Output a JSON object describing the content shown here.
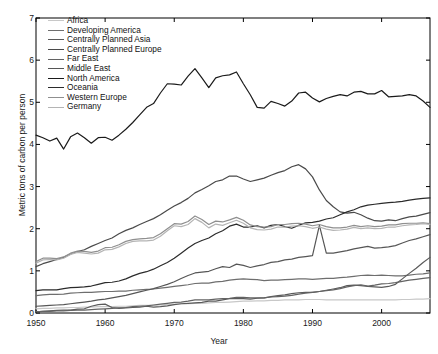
{
  "chart_data": {
    "type": "line",
    "title": "",
    "xlabel": "Year",
    "ylabel": "Metric tons of carbon per person",
    "xlim": [
      1950,
      2007
    ],
    "ylim": [
      0,
      7
    ],
    "xticks": [
      1950,
      1960,
      1970,
      1980,
      1990,
      2000
    ],
    "yticks": [
      0,
      1,
      2,
      3,
      4,
      5,
      6,
      7
    ],
    "grid": false,
    "legend_position": "top-left",
    "x": [
      1950,
      1951,
      1952,
      1953,
      1954,
      1955,
      1956,
      1957,
      1958,
      1959,
      1960,
      1961,
      1962,
      1963,
      1964,
      1965,
      1966,
      1967,
      1968,
      1969,
      1970,
      1971,
      1972,
      1973,
      1974,
      1975,
      1976,
      1977,
      1978,
      1979,
      1980,
      1981,
      1982,
      1983,
      1984,
      1985,
      1986,
      1987,
      1988,
      1989,
      1990,
      1991,
      1992,
      1993,
      1994,
      1995,
      1996,
      1997,
      1998,
      1999,
      2000,
      2001,
      2002,
      2003,
      2004,
      2005,
      2006,
      2007
    ],
    "series": [
      {
        "name": "Africa",
        "color": "#c8c8c8",
        "values": [
          0.1,
          0.11,
          0.11,
          0.12,
          0.12,
          0.13,
          0.13,
          0.14,
          0.14,
          0.15,
          0.15,
          0.15,
          0.16,
          0.16,
          0.17,
          0.18,
          0.18,
          0.18,
          0.19,
          0.2,
          0.21,
          0.22,
          0.22,
          0.23,
          0.23,
          0.24,
          0.25,
          0.25,
          0.26,
          0.27,
          0.28,
          0.28,
          0.29,
          0.29,
          0.3,
          0.3,
          0.31,
          0.31,
          0.31,
          0.32,
          0.32,
          0.32,
          0.31,
          0.31,
          0.31,
          0.31,
          0.31,
          0.31,
          0.31,
          0.31,
          0.31,
          0.31,
          0.31,
          0.32,
          0.32,
          0.33,
          0.33,
          0.34
        ]
      },
      {
        "name": "Developing America",
        "color": "#6e6e6e",
        "values": [
          0.41,
          0.43,
          0.44,
          0.44,
          0.45,
          0.47,
          0.48,
          0.49,
          0.49,
          0.5,
          0.51,
          0.51,
          0.52,
          0.52,
          0.54,
          0.55,
          0.56,
          0.57,
          0.59,
          0.61,
          0.63,
          0.65,
          0.67,
          0.7,
          0.71,
          0.71,
          0.74,
          0.75,
          0.78,
          0.8,
          0.81,
          0.8,
          0.79,
          0.77,
          0.78,
          0.78,
          0.79,
          0.8,
          0.81,
          0.81,
          0.8,
          0.81,
          0.82,
          0.82,
          0.84,
          0.85,
          0.87,
          0.89,
          0.9,
          0.89,
          0.9,
          0.89,
          0.88,
          0.88,
          0.9,
          0.92,
          0.93,
          0.95
        ]
      },
      {
        "name": "Centrally Planned Asia",
        "color": "#5a5a5a",
        "values": [
          0.03,
          0.04,
          0.05,
          0.06,
          0.07,
          0.07,
          0.09,
          0.1,
          0.16,
          0.2,
          0.21,
          0.13,
          0.11,
          0.12,
          0.13,
          0.14,
          0.16,
          0.14,
          0.15,
          0.17,
          0.2,
          0.22,
          0.23,
          0.24,
          0.25,
          0.28,
          0.28,
          0.31,
          0.34,
          0.34,
          0.34,
          0.33,
          0.35,
          0.36,
          0.39,
          0.41,
          0.43,
          0.46,
          0.48,
          0.49,
          0.49,
          0.51,
          0.54,
          0.57,
          0.6,
          0.65,
          0.66,
          0.65,
          0.63,
          0.62,
          0.61,
          0.63,
          0.68,
          0.81,
          0.94,
          1.06,
          1.2,
          1.32
        ]
      },
      {
        "name": "Centrally Planned Europe",
        "color": "#4a4a4a",
        "values": [
          1.1,
          1.17,
          1.22,
          1.27,
          1.32,
          1.4,
          1.46,
          1.5,
          1.58,
          1.65,
          1.72,
          1.78,
          1.88,
          1.96,
          2.02,
          2.1,
          2.17,
          2.24,
          2.33,
          2.44,
          2.54,
          2.62,
          2.72,
          2.85,
          2.93,
          3.02,
          3.12,
          3.16,
          3.25,
          3.25,
          3.18,
          3.12,
          3.16,
          3.2,
          3.27,
          3.33,
          3.38,
          3.47,
          3.52,
          3.42,
          3.23,
          2.92,
          2.67,
          2.52,
          2.4,
          2.37,
          2.39,
          2.33,
          2.25,
          2.19,
          2.18,
          2.21,
          2.19,
          2.24,
          2.28,
          2.3,
          2.34,
          2.38
        ]
      },
      {
        "name": "Far East",
        "color": "#636363",
        "values": [
          0.03,
          0.04,
          0.04,
          0.05,
          0.05,
          0.06,
          0.07,
          0.07,
          0.08,
          0.09,
          0.1,
          0.11,
          0.12,
          0.13,
          0.15,
          0.16,
          0.17,
          0.19,
          0.21,
          0.23,
          0.25,
          0.26,
          0.28,
          0.31,
          0.31,
          0.31,
          0.33,
          0.34,
          0.35,
          0.37,
          0.37,
          0.36,
          0.36,
          0.36,
          0.38,
          0.39,
          0.4,
          0.42,
          0.45,
          0.47,
          0.49,
          0.51,
          0.53,
          0.55,
          0.58,
          0.62,
          0.65,
          0.67,
          0.64,
          0.66,
          0.69,
          0.7,
          0.72,
          0.75,
          0.78,
          0.8,
          0.82,
          0.84
        ]
      },
      {
        "name": "Middle East",
        "color": "#565656",
        "values": [
          0.16,
          0.17,
          0.18,
          0.19,
          0.2,
          0.22,
          0.24,
          0.26,
          0.28,
          0.31,
          0.33,
          0.36,
          0.39,
          0.42,
          0.46,
          0.5,
          0.54,
          0.58,
          0.63,
          0.68,
          0.74,
          0.82,
          0.89,
          0.95,
          0.97,
          0.99,
          1.05,
          1.1,
          1.08,
          1.16,
          1.13,
          1.08,
          1.12,
          1.15,
          1.2,
          1.22,
          1.26,
          1.28,
          1.32,
          1.34,
          1.36,
          2.08,
          1.42,
          1.42,
          1.45,
          1.48,
          1.52,
          1.55,
          1.58,
          1.54,
          1.55,
          1.57,
          1.6,
          1.66,
          1.72,
          1.76,
          1.81,
          1.86
        ]
      },
      {
        "name": "North America",
        "color": "#1a1a1a",
        "values": [
          4.22,
          4.16,
          4.08,
          4.15,
          3.89,
          4.18,
          4.27,
          4.16,
          4.03,
          4.16,
          4.17,
          4.1,
          4.22,
          4.36,
          4.52,
          4.7,
          4.88,
          4.97,
          5.22,
          5.44,
          5.43,
          5.41,
          5.62,
          5.8,
          5.58,
          5.35,
          5.58,
          5.63,
          5.65,
          5.72,
          5.44,
          5.18,
          4.88,
          4.86,
          5.02,
          4.97,
          4.91,
          5.03,
          5.22,
          5.24,
          5.1,
          5.01,
          5.09,
          5.14,
          5.18,
          5.15,
          5.24,
          5.26,
          5.2,
          5.2,
          5.28,
          5.13,
          5.14,
          5.15,
          5.18,
          5.15,
          5.03,
          4.88
        ]
      },
      {
        "name": "Oceania",
        "color": "#2b2b2b",
        "values": [
          0.53,
          0.55,
          0.55,
          0.55,
          0.58,
          0.6,
          0.61,
          0.62,
          0.64,
          0.68,
          0.72,
          0.73,
          0.76,
          0.81,
          0.88,
          0.94,
          0.98,
          1.04,
          1.12,
          1.2,
          1.3,
          1.42,
          1.54,
          1.65,
          1.72,
          1.78,
          1.88,
          1.95,
          2.06,
          2.11,
          2.04,
          2.04,
          2.07,
          2.02,
          2.08,
          2.1,
          2.05,
          2.01,
          2.08,
          2.14,
          2.15,
          2.18,
          2.23,
          2.26,
          2.33,
          2.4,
          2.45,
          2.52,
          2.56,
          2.58,
          2.6,
          2.62,
          2.63,
          2.65,
          2.68,
          2.7,
          2.72,
          2.73
        ]
      },
      {
        "name": "Western Europe",
        "color": "#8f8f8f",
        "values": [
          1.22,
          1.3,
          1.3,
          1.29,
          1.33,
          1.42,
          1.47,
          1.46,
          1.44,
          1.47,
          1.55,
          1.56,
          1.62,
          1.7,
          1.74,
          1.76,
          1.77,
          1.79,
          1.88,
          2.0,
          2.12,
          2.11,
          2.17,
          2.3,
          2.22,
          2.1,
          2.18,
          2.16,
          2.21,
          2.27,
          2.2,
          2.09,
          2.05,
          2.04,
          2.05,
          2.1,
          2.1,
          2.12,
          2.13,
          2.11,
          2.07,
          2.1,
          2.05,
          2.02,
          2.02,
          2.04,
          2.08,
          2.05,
          2.07,
          2.05,
          2.06,
          2.09,
          2.09,
          2.12,
          2.13,
          2.13,
          2.14,
          2.12
        ]
      },
      {
        "name": "Germany",
        "color": "#b4b4b4",
        "values": [
          1.18,
          1.26,
          1.27,
          1.26,
          1.3,
          1.39,
          1.44,
          1.42,
          1.4,
          1.42,
          1.5,
          1.51,
          1.57,
          1.65,
          1.7,
          1.71,
          1.71,
          1.73,
          1.82,
          1.95,
          2.07,
          2.05,
          2.1,
          2.24,
          2.15,
          2.02,
          2.11,
          2.08,
          2.14,
          2.2,
          2.13,
          2.02,
          1.98,
          1.97,
          1.99,
          2.04,
          2.04,
          2.06,
          2.07,
          2.05,
          2.01,
          2.04,
          1.99,
          1.96,
          1.97,
          1.99,
          2.03,
          2.0,
          2.02,
          2.0,
          2.01,
          2.04,
          2.04,
          2.07,
          2.09,
          2.1,
          2.12,
          2.1
        ]
      }
    ]
  },
  "axes": {
    "y_tick_labels": [
      "0",
      "1",
      "2",
      "3",
      "4",
      "5",
      "6",
      "7"
    ],
    "x_tick_labels": [
      "1950",
      "1960",
      "1970",
      "1980",
      "1990",
      "2000"
    ],
    "y_axis_title": "Metric tons of carbon per person",
    "x_axis_title": "Year"
  }
}
